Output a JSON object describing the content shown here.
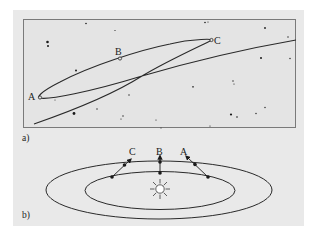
{
  "figure": {
    "panel_a": {
      "label": "a)",
      "description": "Apparent path of a planet against background stars showing retrograde loop",
      "points": [
        {
          "name": "A",
          "label": "A"
        },
        {
          "name": "B",
          "label": "B"
        },
        {
          "name": "C",
          "label": "C"
        }
      ]
    },
    "panel_b": {
      "label": "b)",
      "description": "Orbits of Earth (inner) and outer planet around the Sun with sight lines",
      "sight_lines": [
        {
          "name": "C",
          "label": "C"
        },
        {
          "name": "B",
          "label": "B"
        },
        {
          "name": "A",
          "label": "A"
        }
      ],
      "center": "sun-icon"
    },
    "colors": {
      "background": "#e9e9e9",
      "line": "#2a2a2a",
      "box_border": "#7a7a7a"
    }
  }
}
